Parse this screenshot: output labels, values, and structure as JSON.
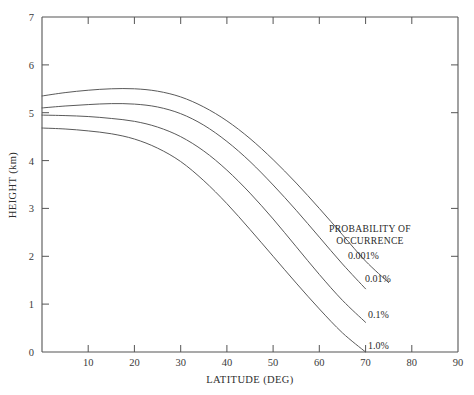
{
  "chart_data": {
    "type": "line",
    "title": "",
    "xlabel": "LATITUDE (DEG)",
    "ylabel": "HEIGHT (km)",
    "xlim": [
      0,
      90
    ],
    "ylim": [
      0,
      7
    ],
    "xticks": [
      0,
      10,
      20,
      30,
      40,
      50,
      60,
      70,
      80,
      90
    ],
    "yticks": [
      0,
      1,
      2,
      3,
      4,
      5,
      6,
      7
    ],
    "xtick_labels": [
      "",
      "10",
      "20",
      "30",
      "40",
      "50",
      "60",
      "70",
      "80",
      "90"
    ],
    "ytick_labels": [
      "0",
      "1",
      "2",
      "3",
      "4",
      "5",
      "6",
      "7"
    ],
    "grid": false,
    "legend_position": "inside-right",
    "legend_title_line1": "PROBABILITY OF",
    "legend_title_line2": "OCCURRENCE",
    "x": [
      0,
      5,
      10,
      15,
      20,
      25,
      30,
      35,
      40,
      45,
      50,
      55,
      60,
      65,
      70,
      75
    ],
    "series": [
      {
        "name": "0.001%",
        "label": "0.001%",
        "values": [
          5.35,
          5.42,
          5.47,
          5.5,
          5.5,
          5.45,
          5.33,
          5.12,
          4.83,
          4.46,
          4.02,
          3.53,
          3.0,
          2.45,
          1.9,
          1.45
        ]
      },
      {
        "name": "0.01%",
        "label": "0.01%",
        "values": [
          5.1,
          5.14,
          5.17,
          5.19,
          5.18,
          5.12,
          4.98,
          4.74,
          4.4,
          3.98,
          3.49,
          2.96,
          2.4,
          1.84,
          1.32,
          null
        ]
      },
      {
        "name": "0.1%",
        "label": "0.1%",
        "values": [
          4.95,
          4.94,
          4.92,
          4.88,
          4.82,
          4.7,
          4.5,
          4.2,
          3.8,
          3.32,
          2.78,
          2.2,
          1.62,
          1.08,
          0.62,
          null
        ]
      },
      {
        "name": "1.0%",
        "label": "1.0%",
        "values": [
          4.68,
          4.66,
          4.62,
          4.56,
          4.45,
          4.26,
          3.98,
          3.58,
          3.1,
          2.56,
          2.0,
          1.44,
          0.9,
          0.4,
          0.0,
          null
        ]
      }
    ]
  },
  "axes": {
    "x_title": "LATITUDE (DEG)",
    "y_title": "HEIGHT (km)"
  },
  "legend": {
    "title_line1": "PROBABILITY OF",
    "title_line2": "OCCURRENCE",
    "items": [
      {
        "label": "0.001%"
      },
      {
        "label": "0.01%"
      },
      {
        "label": "0.1%"
      },
      {
        "label": "1.0%"
      }
    ]
  },
  "ticks": {
    "x": [
      "10",
      "20",
      "30",
      "40",
      "50",
      "60",
      "70",
      "80",
      "90"
    ],
    "y": [
      "0",
      "1",
      "2",
      "3",
      "4",
      "5",
      "6",
      "7"
    ]
  },
  "colors": {
    "background": "#ffffff",
    "axis": "#555555",
    "curve": "#5a5a5a",
    "text": "#2a2a2a"
  }
}
